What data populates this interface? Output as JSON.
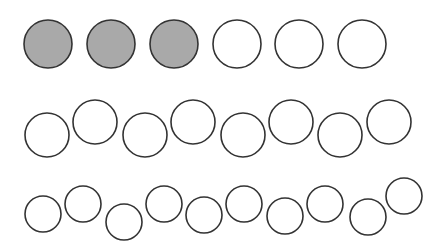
{
  "diagram": {
    "title": "",
    "colors": {
      "background": "#ffffff",
      "stroke": "#333333",
      "shaded_fill": "#a9a9a9",
      "empty_fill": "#ffffff"
    },
    "rows": [
      {
        "name": "row-1",
        "count": 6,
        "shaded_count": 3,
        "circles": [
          {
            "cx": 48,
            "cy": 44,
            "r": 24,
            "shaded": true
          },
          {
            "cx": 111,
            "cy": 44,
            "r": 24,
            "shaded": true
          },
          {
            "cx": 174,
            "cy": 44,
            "r": 24,
            "shaded": true
          },
          {
            "cx": 237,
            "cy": 44,
            "r": 24,
            "shaded": false
          },
          {
            "cx": 299,
            "cy": 44,
            "r": 24,
            "shaded": false
          },
          {
            "cx": 362,
            "cy": 44,
            "r": 24,
            "shaded": false
          }
        ]
      },
      {
        "name": "row-2",
        "count": 8,
        "shaded_count": 0,
        "circles": [
          {
            "cx": 47,
            "cy": 135,
            "r": 22,
            "shaded": false
          },
          {
            "cx": 95,
            "cy": 122,
            "r": 22,
            "shaded": false
          },
          {
            "cx": 145,
            "cy": 135,
            "r": 22,
            "shaded": false
          },
          {
            "cx": 193,
            "cy": 122,
            "r": 22,
            "shaded": false
          },
          {
            "cx": 243,
            "cy": 135,
            "r": 22,
            "shaded": false
          },
          {
            "cx": 291,
            "cy": 122,
            "r": 22,
            "shaded": false
          },
          {
            "cx": 340,
            "cy": 135,
            "r": 22,
            "shaded": false
          },
          {
            "cx": 389,
            "cy": 122,
            "r": 22,
            "shaded": false
          }
        ]
      },
      {
        "name": "row-3",
        "count": 10,
        "shaded_count": 0,
        "circles": [
          {
            "cx": 43,
            "cy": 214,
            "r": 18,
            "shaded": false
          },
          {
            "cx": 83,
            "cy": 204,
            "r": 18,
            "shaded": false
          },
          {
            "cx": 124,
            "cy": 222,
            "r": 18,
            "shaded": false
          },
          {
            "cx": 164,
            "cy": 204,
            "r": 18,
            "shaded": false
          },
          {
            "cx": 204,
            "cy": 215,
            "r": 18,
            "shaded": false
          },
          {
            "cx": 244,
            "cy": 204,
            "r": 18,
            "shaded": false
          },
          {
            "cx": 285,
            "cy": 216,
            "r": 18,
            "shaded": false
          },
          {
            "cx": 325,
            "cy": 204,
            "r": 18,
            "shaded": false
          },
          {
            "cx": 368,
            "cy": 217,
            "r": 18,
            "shaded": false
          },
          {
            "cx": 404,
            "cy": 196,
            "r": 18,
            "shaded": false
          }
        ]
      }
    ]
  }
}
